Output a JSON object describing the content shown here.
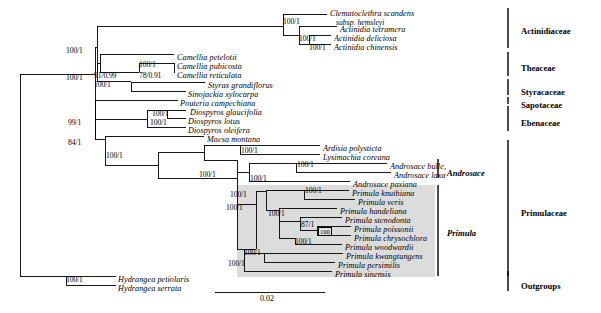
{
  "figure": {
    "type": "phylogenetic-tree",
    "scale_bar": {
      "label": "0.02",
      "x": 215,
      "y": 292,
      "width": 110
    }
  },
  "taxa": [
    {
      "id": "clematoclethra_scandens",
      "name": "Clematoclethra scandens",
      "subsp": "subsp. hemsleyi",
      "x": 330,
      "y": 10
    },
    {
      "id": "actinidia_tetramera",
      "name": "Actinidia tetramera",
      "x": 340,
      "y": 26
    },
    {
      "id": "actinidia_deliciosa",
      "name": "Actinidia deliciosa",
      "x": 334,
      "y": 35
    },
    {
      "id": "actinidia_chinensis",
      "name": "Actinidia chinensis",
      "x": 334,
      "y": 44
    },
    {
      "id": "camellia_petelotii",
      "name": "Camellia petelotii",
      "x": 177,
      "y": 54
    },
    {
      "id": "camellia_pubicosta",
      "name": "Camellia pubicosta",
      "x": 177,
      "y": 63
    },
    {
      "id": "camellia_reticulata",
      "name": "Camellia reticulata",
      "x": 177,
      "y": 72
    },
    {
      "id": "styrax_grandiflorus",
      "name": "Styrax grandiflorus",
      "x": 208,
      "y": 82
    },
    {
      "id": "sinojackia_xylocarpa",
      "name": "Sinojackia xylocarpa",
      "x": 188,
      "y": 91
    },
    {
      "id": "pouteria_campechiana",
      "name": "Pouteria campechiana",
      "x": 180,
      "y": 100
    },
    {
      "id": "diospyros_glaucifolia",
      "name": "Diospyros glaucifolia",
      "x": 190,
      "y": 109
    },
    {
      "id": "diospyros_lotus",
      "name": "Diospyros lotus",
      "x": 188,
      "y": 118
    },
    {
      "id": "diospyros_oleifera",
      "name": "Diospyros oleifera",
      "x": 188,
      "y": 127
    },
    {
      "id": "maesa_montana",
      "name": "Maesa montana",
      "x": 207,
      "y": 136
    },
    {
      "id": "ardisia_polysticta",
      "name": "Ardisia polysticta",
      "x": 323,
      "y": 145
    },
    {
      "id": "lysimachia_coreana",
      "name": "Lysimachia coreana",
      "x": 323,
      "y": 154
    },
    {
      "id": "androsace_bulle",
      "name": "Androsace bulle,",
      "x": 390,
      "y": 163
    },
    {
      "id": "androsace_laxa",
      "name": "Androsace laxa",
      "x": 394,
      "y": 172
    },
    {
      "id": "androsace_paxiana",
      "name": "Androsace paxiana",
      "x": 353,
      "y": 181
    },
    {
      "id": "primula_knuthiana",
      "name": "Primula knuthiana",
      "x": 352,
      "y": 190
    },
    {
      "id": "primula_veris",
      "name": "Primula veris",
      "x": 358,
      "y": 199
    },
    {
      "id": "primula_handeliana",
      "name": "Primula handeliana",
      "x": 340,
      "y": 208
    },
    {
      "id": "primula_stenodonta",
      "name": "Primula stenodonta",
      "x": 345,
      "y": 217
    },
    {
      "id": "primula_poissonii",
      "name": "Primula poissonii",
      "x": 354,
      "y": 226
    },
    {
      "id": "primula_chrysochlora",
      "name": "Primula chrysochlora",
      "x": 354,
      "y": 235
    },
    {
      "id": "primula_woodwardii",
      "name": "Primula woodwardii",
      "x": 345,
      "y": 244
    },
    {
      "id": "primula_kwangtungens",
      "name": "Primula kwangtungens",
      "x": 346,
      "y": 253
    },
    {
      "id": "primula_persimilis",
      "name": "Primula persimilis",
      "x": 338,
      "y": 262
    },
    {
      "id": "primula_sinensis",
      "name": "Primula sinensis",
      "x": 335,
      "y": 271
    },
    {
      "id": "hydrangea_petiolaris",
      "name": "Hydrangea petiolaris",
      "x": 118,
      "y": 276
    },
    {
      "id": "hydrangea_serrata",
      "name": "Hydrangea serrata",
      "x": 118,
      "y": 285
    }
  ],
  "support_values": [
    {
      "id": "s-actinidiaceae-crown",
      "label": "100/1",
      "x": 283,
      "y": 18
    },
    {
      "id": "s-actinidia",
      "label": "100/1",
      "x": 299,
      "y": 35
    },
    {
      "id": "s-actinidia-dc",
      "label": "100/1",
      "x": 309,
      "y": 44
    },
    {
      "id": "s-theaceae-stem",
      "label": "100/1",
      "x": 66,
      "y": 47
    },
    {
      "id": "s-camellia-crown",
      "label": "100/1",
      "x": 139,
      "y": 61
    },
    {
      "id": "s-camellia-split",
      "label": "91/0.99",
      "x": 94,
      "y": 72
    },
    {
      "id": "s-camellia-pair",
      "label": "78/0.91",
      "x": 139,
      "y": 72
    },
    {
      "id": "s-core-asterid",
      "label": "100/1",
      "x": 66,
      "y": 74
    },
    {
      "id": "s-styracaceae",
      "label": "100/1",
      "x": 94,
      "y": 81
    },
    {
      "id": "s-diospyros-crown",
      "label": "100/1",
      "x": 152,
      "y": 110
    },
    {
      "id": "s-diospyros-stem",
      "label": "100/1",
      "x": 150,
      "y": 119
    },
    {
      "id": "s-ebenaceae-node",
      "label": "99/1",
      "x": 68,
      "y": 119
    },
    {
      "id": "s-primulaceae-stem",
      "label": "84/1",
      "x": 68,
      "y": 139
    },
    {
      "id": "s-ardisia-lysimachia",
      "label": "100/1",
      "x": 241,
      "y": 147
    },
    {
      "id": "s-maesa-sister",
      "label": "100/1",
      "x": 106,
      "y": 152
    },
    {
      "id": "s-androsace-pair",
      "label": "100/1",
      "x": 297,
      "y": 161
    },
    {
      "id": "s-primulaceae-core",
      "label": "100/1",
      "x": 199,
      "y": 171
    },
    {
      "id": "s-androsace-clade",
      "label": "100/1",
      "x": 250,
      "y": 175
    },
    {
      "id": "s-primula-knuthiana-veris",
      "label": "100/1",
      "x": 305,
      "y": 187
    },
    {
      "id": "s-primula-crown",
      "label": "100/1",
      "x": 226,
      "y": 204
    },
    {
      "id": "s-androsace-primula",
      "label": "100/1",
      "x": 230,
      "y": 191
    },
    {
      "id": "s-primula-sect",
      "label": "100/1",
      "x": 268,
      "y": 210
    },
    {
      "id": "s-primula-poissonii-grp",
      "label": "87/1",
      "x": 301,
      "y": 221
    },
    {
      "id": "s-primula-boxed",
      "label": "100",
      "x": 318,
      "y": 227,
      "boxed": true
    },
    {
      "id": "s-primula-woodwardii",
      "label": "100/1",
      "x": 295,
      "y": 238
    },
    {
      "id": "s-primula-basal",
      "label": "100/1",
      "x": 244,
      "y": 249
    },
    {
      "id": "s-primula-sinensis-grp",
      "label": "100/1",
      "x": 228,
      "y": 260
    },
    {
      "id": "s-outgroups",
      "label": "100/1",
      "x": 66,
      "y": 276
    }
  ],
  "clade_labels": [
    {
      "id": "actinidiaceae",
      "label": "Actinidiaceae",
      "x": 521,
      "y": 26,
      "italic": false,
      "bar": {
        "x": 508,
        "y0": 8,
        "y1": 48
      }
    },
    {
      "id": "theaceae",
      "label": "Theaceae",
      "x": 521,
      "y": 63,
      "italic": false,
      "bar": {
        "x": 508,
        "y0": 52,
        "y1": 76
      }
    },
    {
      "id": "styracaceae",
      "label": "Styracaceae",
      "x": 521,
      "y": 87,
      "italic": false,
      "bar": {
        "x": 508,
        "y0": 79,
        "y1": 95
      }
    },
    {
      "id": "sapotaceae",
      "label": "Sapotaceae",
      "x": 521,
      "y": 100,
      "italic": false,
      "bar": {
        "x": 508,
        "y0": 97,
        "y1": 104
      }
    },
    {
      "id": "ebenaceae",
      "label": "Ebenaceae",
      "x": 521,
      "y": 118,
      "italic": false,
      "bar": {
        "x": 508,
        "y0": 106,
        "y1": 131
      }
    },
    {
      "id": "androsace",
      "label": "Androsace",
      "x": 447,
      "y": 168,
      "italic": true,
      "bar": {
        "x": 438,
        "y0": 159,
        "y1": 178
      }
    },
    {
      "id": "primula",
      "label": "Primula",
      "x": 447,
      "y": 228,
      "italic": true,
      "bar": {
        "x": 438,
        "y0": 185,
        "y1": 276
      }
    },
    {
      "id": "primulaceae",
      "label": "Primulaceae",
      "x": 521,
      "y": 208,
      "italic": false,
      "bar": {
        "x": 508,
        "y0": 140,
        "y1": 276
      }
    },
    {
      "id": "outgroups",
      "label": "Outgroups",
      "x": 521,
      "y": 281,
      "italic": false,
      "bar": {
        "x": 508,
        "y0": 271,
        "y1": 291
      }
    }
  ],
  "shade_box": {
    "x": 237,
    "y": 185,
    "width": 198,
    "height": 92
  }
}
